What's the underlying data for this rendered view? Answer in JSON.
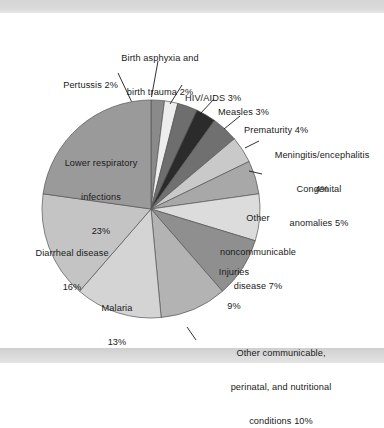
{
  "figure": {
    "background_color": "#ffffff",
    "band_color": "#d9d9d9",
    "text_color": "#1a1a1a"
  },
  "chart_data": {
    "type": "pie",
    "title": "",
    "subtitle": "",
    "xlabel": "",
    "ylabel": "",
    "legend_position": "callout-labels",
    "grid": false,
    "units": "percent",
    "start_angle_deg": 0,
    "direction": "clockwise",
    "categories": [
      "Pertussis",
      "Birth asphyxia and birth trauma",
      "HIV/AIDS",
      "Measles",
      "Prematurity",
      "Meningitis/encephalitis",
      "Congenital anomalies",
      "Other noncommunicable disease",
      "Injuries",
      "Other communicable, perinatal, and nutritional conditions",
      "Malaria",
      "Diarrheal disease",
      "Lower respiratory infections"
    ],
    "values": [
      2,
      2,
      3,
      3,
      4,
      4,
      5,
      7,
      9,
      10,
      13,
      16,
      23
    ],
    "colors": [
      "#8a8a8a",
      "#ededed",
      "#6e6e6e",
      "#2b2b2b",
      "#707070",
      "#c9c9c9",
      "#a8a8a8",
      "#dcdcdc",
      "#8f8f8f",
      "#b3b3b3",
      "#d4d4d4",
      "#c4c4c4",
      "#9a9a9a"
    ],
    "slice_labels": [
      "Pertussis 2%",
      "Birth asphyxia and\nbirth trauma 2%",
      "HIV/AIDS 3%",
      "Measles 3%",
      "Prematurity 4%",
      "Meningitis/encephalitis\n4%",
      "Congenital\nanomalies 5%",
      "Other\nnoncommunicable\ndisease 7%",
      "Injuries\n9%",
      "Other communicable,\nperinatal, and nutritional\nconditions 10%",
      "Malaria\n13%",
      "Diarrheal disease\n16%",
      "Lower respiratory\ninfections\n23%"
    ]
  },
  "labels": {
    "pertussis": {
      "line1": "Pertussis 2%"
    },
    "birth_asphyxia": {
      "line1": "Birth asphyxia and",
      "line2": "birth trauma 2%"
    },
    "hiv_aids": {
      "line1": "HIV/AIDS 3%"
    },
    "measles": {
      "line1": "Measles 3%"
    },
    "prematurity": {
      "line1": "Prematurity 4%"
    },
    "meningitis": {
      "line1": "Meningitis/encephalitis",
      "line2": "4%"
    },
    "congenital": {
      "line1": "Congenital",
      "line2": "anomalies 5%"
    },
    "other_noncommunicable": {
      "line1": "Other",
      "line2": "noncommunicable",
      "line3": "disease 7%"
    },
    "injuries": {
      "line1": "Injuries",
      "line2": "9%"
    },
    "other_communicable": {
      "line1": "Other communicable,",
      "line2": "perinatal, and nutritional",
      "line3": "conditions 10%"
    },
    "malaria": {
      "line1": "Malaria",
      "line2": "13%"
    },
    "diarrheal": {
      "line1": "Diarrheal disease",
      "line2": "16%"
    },
    "lower_respiratory": {
      "line1": "Lower respiratory",
      "line2": "infections",
      "line3": "23%"
    }
  }
}
